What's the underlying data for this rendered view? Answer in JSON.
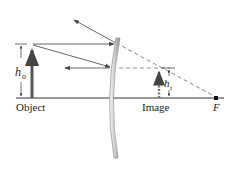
{
  "diagram": {
    "labels": {
      "object": "Object",
      "image": "Image",
      "focal_point": "F",
      "object_height": "h",
      "object_height_sub": "o",
      "image_height": "h",
      "image_height_sub": "i"
    },
    "colors": {
      "ray": "#555555",
      "axis": "#333333",
      "object_arrow": "#555555",
      "dashed": "#777777",
      "mirror_light": "#e6e6e6",
      "mirror_dark": "#8a8a8a",
      "text": "#231f20"
    }
  }
}
